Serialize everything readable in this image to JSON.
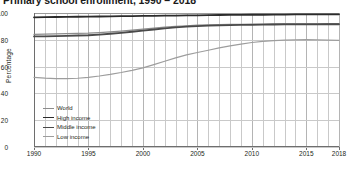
{
  "chart_data": {
    "type": "line",
    "title": "Primary school enrollment, 1990 – 2018",
    "xlabel": "",
    "ylabel": "Percentage",
    "xlim": [
      1990,
      2018
    ],
    "ylim": [
      0,
      100
    ],
    "yticks": [
      0,
      20,
      40,
      60,
      80,
      100
    ],
    "xticks": [
      1990,
      1995,
      2000,
      2005,
      2010,
      2015,
      2018
    ],
    "xtick_labels": [
      "1990",
      "1995",
      "2000",
      "2005",
      "2010",
      "2015",
      "2018"
    ],
    "ytick_labels": [
      "0",
      "20",
      "40",
      "60",
      "80",
      "100"
    ],
    "grid": true,
    "grid_detail": "annual vertical gridlines; horizontal gridlines at each 20% tick",
    "legend_position": "inside lower-left",
    "x": [
      1990,
      1991,
      1992,
      1993,
      1994,
      1995,
      1996,
      1997,
      1998,
      1999,
      2000,
      2001,
      2002,
      2003,
      2004,
      2005,
      2006,
      2007,
      2008,
      2009,
      2010,
      2011,
      2012,
      2013,
      2014,
      2015,
      2016,
      2017,
      2018
    ],
    "series": [
      {
        "name": "World",
        "color": "#8c8c8c",
        "width": 1.2,
        "values": [
          84.0,
          84.2,
          84.4,
          84.6,
          84.8,
          85.0,
          85.4,
          85.9,
          86.5,
          87.2,
          88.0,
          88.7,
          89.4,
          90.0,
          90.5,
          90.9,
          91.2,
          91.4,
          91.5,
          91.6,
          91.7,
          91.8,
          91.9,
          92.0,
          92.0,
          92.0,
          92.0,
          92.0,
          92.0
        ]
      },
      {
        "name": "High income",
        "color": "#2b2b2b",
        "width": 1.8,
        "values": [
          96.8,
          96.9,
          97.0,
          97.1,
          97.2,
          97.3,
          97.4,
          97.5,
          97.6,
          97.7,
          97.8,
          97.9,
          98.0,
          98.1,
          98.2,
          98.3,
          98.4,
          98.5,
          98.6,
          98.6,
          98.7,
          98.7,
          98.8,
          98.8,
          98.9,
          98.9,
          98.9,
          99.0,
          99.0
        ]
      },
      {
        "name": "Middle income",
        "color": "#4a4a4a",
        "width": 1.8,
        "values": [
          82.5,
          82.6,
          82.8,
          83.0,
          83.2,
          83.4,
          83.9,
          84.5,
          85.2,
          86.0,
          86.9,
          87.7,
          88.5,
          89.2,
          89.8,
          90.2,
          90.6,
          90.8,
          91.0,
          91.1,
          91.2,
          91.3,
          91.4,
          91.5,
          91.5,
          91.5,
          91.5,
          91.6,
          91.6
        ]
      },
      {
        "name": "Low income",
        "color": "#9d9d9d",
        "width": 1.2,
        "values": [
          52.0,
          51.4,
          51.0,
          51.0,
          51.3,
          52.0,
          53.0,
          54.2,
          55.6,
          57.2,
          59.0,
          61.5,
          64.0,
          66.5,
          68.8,
          70.5,
          72.2,
          74.0,
          75.5,
          76.8,
          78.0,
          78.8,
          79.4,
          79.8,
          80.0,
          80.1,
          80.0,
          79.8,
          79.6
        ]
      }
    ]
  },
  "legend": {
    "items": [
      {
        "label": "World"
      },
      {
        "label": "High income"
      },
      {
        "label": "Middle income"
      },
      {
        "label": "Low income"
      }
    ]
  }
}
